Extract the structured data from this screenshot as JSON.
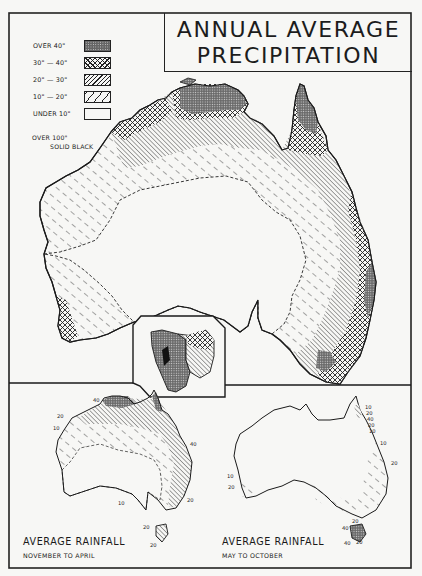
{
  "title": {
    "line1": "ANNUAL AVERAGE",
    "line2": "PRECIPITATION"
  },
  "legend": {
    "items": [
      {
        "label": "OVER   40\"",
        "pattern": "fine-dots-dark"
      },
      {
        "label": "30\"  —  40\"",
        "pattern": "crosshatch"
      },
      {
        "label": "20\"  —  30\"",
        "pattern": "dense-diagonal"
      },
      {
        "label": "10\"  —  20\"",
        "pattern": "dashed-diagonal"
      },
      {
        "label": "UNDER 10\"",
        "pattern": "blank"
      }
    ],
    "note_line1": "OVER 100\"",
    "note_line2": "SOLID BLACK"
  },
  "main_map": {
    "region": "Australia",
    "inset": "Tasmania"
  },
  "panels": [
    {
      "title": "AVERAGE RAINFALL",
      "subtitle": "NOVEMBER TO APRIL",
      "isohyet_labels": [
        "40",
        "20",
        "10",
        "40",
        "10",
        "20",
        "20",
        "20"
      ]
    },
    {
      "title": "AVERAGE RAINFALL",
      "subtitle": "MAY TO OCTOBER",
      "isohyet_labels": [
        "10",
        "20",
        "40",
        "20",
        "10",
        "10",
        "20",
        "10",
        "20",
        "20",
        "40",
        "40",
        "20"
      ]
    }
  ],
  "colors": {
    "ink": "#1a1a1a",
    "paper": "#f7f7f5",
    "dark_fill": "#555555"
  }
}
